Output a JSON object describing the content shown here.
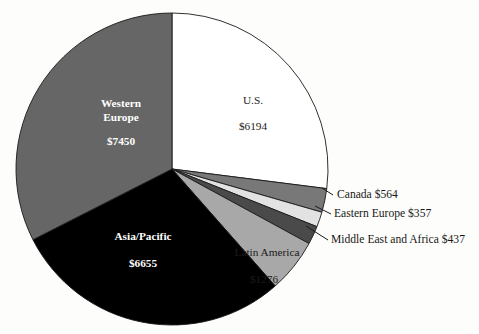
{
  "chart_data": {
    "type": "pie",
    "title": "",
    "subtitle": "",
    "xlabel": "",
    "ylabel": "",
    "legend_position": "none",
    "grid": false,
    "currency_prefix": "$",
    "total": 22933,
    "start_angle_deg": 0,
    "direction": "clockwise",
    "categories": [
      "U.S.",
      "Canada",
      "Eastern Europe",
      "Middle East and Africa",
      "Latin America",
      "Asia/Pacific",
      "Western Europe"
    ],
    "values": [
      6194,
      564,
      357,
      437,
      1276,
      6655,
      7450
    ],
    "slices": [
      {
        "name": "U.S.",
        "value": 6194,
        "value_label": "$6194",
        "color": "#ffffff",
        "label_placement": "inside",
        "label_text_color": "#1b1b1b",
        "percent": 27.0
      },
      {
        "name": "Canada",
        "value": 564,
        "value_label": "$564",
        "color": "#787878",
        "label_placement": "callout",
        "label_text_color": "#181818",
        "percent": 2.5
      },
      {
        "name": "Eastern Europe",
        "value": 357,
        "value_label": "$357",
        "color": "#e2e2e2",
        "label_placement": "callout",
        "label_text_color": "#181818",
        "percent": 1.6
      },
      {
        "name": "Middle East and Africa",
        "value": 437,
        "value_label": "$437",
        "color": "#4a4a4a",
        "label_placement": "callout",
        "label_text_color": "#181818",
        "percent": 1.9
      },
      {
        "name": "Latin America",
        "value": 1276,
        "value_label": "$1276",
        "color": "#a8a8a8",
        "label_placement": "inside",
        "label_text_color": "#1b1b1b",
        "percent": 5.6
      },
      {
        "name": "Asia/Pacific",
        "value": 6655,
        "value_label": "$6655",
        "color": "#000000",
        "label_placement": "inside",
        "label_text_color": "#ffffff",
        "percent": 29.0
      },
      {
        "name": "Western Europe",
        "value": 7450,
        "value_label": "$7450",
        "color": "#666666",
        "label_placement": "inside",
        "label_text_color": "#ffffff",
        "percent": 32.5
      }
    ]
  },
  "inside_labels": {
    "us_name": "U.S.",
    "us_value": "$6194",
    "western_europe_name_line1": "Western",
    "western_europe_name_line2": "Europe",
    "western_europe_value": "$7450",
    "asia_pacific_name": "Asia/Pacific",
    "asia_pacific_value": "$6655",
    "latin_america_name": "Latin America",
    "latin_america_value": "$1276"
  },
  "callouts": {
    "canada": "Canada   $564",
    "eastern_europe": "Eastern Europe   $357",
    "middle_east_africa": "Middle East and Africa   $437"
  },
  "colors": {
    "background": "#fdfdfb",
    "outline": "#1a1a1a",
    "us": "#ffffff",
    "canada": "#787878",
    "eastern_europe": "#e2e2e2",
    "middle_east_africa": "#4a4a4a",
    "latin_america": "#a8a8a8",
    "asia_pacific": "#000000",
    "western_europe": "#666666"
  }
}
